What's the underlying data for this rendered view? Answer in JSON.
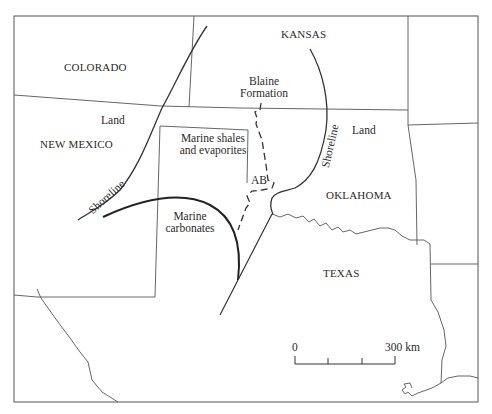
{
  "map": {
    "states": {
      "colorado": "COLORADO",
      "kansas": "KANSAS",
      "new_mexico": "NEW MEXICO",
      "oklahoma": "OKLAHOMA",
      "texas": "TEXAS"
    },
    "regions": {
      "land_west": "Land",
      "land_east": "Land",
      "marine_shales_line1": "Marine shales",
      "marine_shales_line2": "and evaporites",
      "marine_carbonates_line1": "Marine",
      "marine_carbonates_line2": "carbonates",
      "blaine_line1": "Blaine",
      "blaine_line2": "Formation",
      "ab": "AB"
    },
    "shorelines": {
      "west": "Shoreline",
      "east": "Shoreline"
    },
    "scale_bar": {
      "start": "0",
      "end": "300 km"
    },
    "colors": {
      "line": "#3a3a3a",
      "border": "#555555",
      "text": "#2a2a2a"
    }
  }
}
